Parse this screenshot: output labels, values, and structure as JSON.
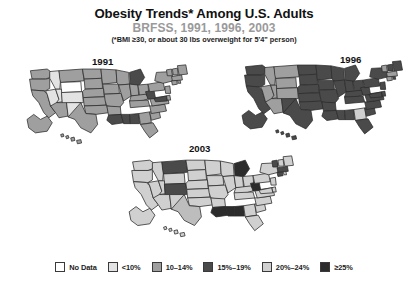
{
  "header": {
    "title": "Obesity Trends* Among U.S. Adults",
    "subtitle": "BRFSS, 1991, 1996, 2003",
    "footnote": "(*BMI ≥30, or about 30 lbs overweight for 5'4\" person)",
    "title_color": "#111111",
    "subtitle_color": "#9a9a9a"
  },
  "maps": [
    {
      "id": "map-1991",
      "year": "1991"
    },
    {
      "id": "map-1996",
      "year": "1996"
    },
    {
      "id": "map-2003",
      "year": "2003"
    }
  ],
  "legend": {
    "items": [
      {
        "label": "No Data",
        "color": "#ffffff"
      },
      {
        "label": "<10%",
        "color": "#e3e3e3"
      },
      {
        "label": "10–14%",
        "color": "#9f9f9f"
      },
      {
        "label": "15%–19%",
        "color": "#4a4a4a"
      },
      {
        "label": "20%–24%",
        "color": "#d0d0d0"
      },
      {
        "label": "≥25%",
        "color": "#2c2c2c"
      }
    ]
  },
  "chart_data": {
    "type": "map",
    "title": "Obesity Trends* Among U.S. Adults",
    "subtitle": "BRFSS, 1991, 1996, 2003",
    "annotation": "(*BMI ≥30, or about 30 lbs overweight for 5'4\" person)",
    "legend_position": "bottom",
    "categories": [
      "No Data",
      "<10%",
      "10–14%",
      "15%–19%",
      "20%–24%",
      "≥25%"
    ],
    "category_colors": [
      "#ffffff",
      "#e3e3e3",
      "#9f9f9f",
      "#4a4a4a",
      "#d0d0d0",
      "#2c2c2c"
    ],
    "panels": [
      {
        "year": "1991",
        "values": {
          "WA": "10–14%",
          "OR": "10–14%",
          "CA": "10–14%",
          "NV": "<10%",
          "ID": "<10%",
          "MT": "10–14%",
          "WY": "No Data",
          "UT": "<10%",
          "AZ": "10–14%",
          "CO": "<10%",
          "NM": "<10%",
          "ND": "10–14%",
          "SD": "10–14%",
          "NE": "10–14%",
          "KS": "10–14%",
          "OK": "10–14%",
          "TX": "10–14%",
          "MN": "10–14%",
          "IA": "10–14%",
          "MO": "10–14%",
          "AR": "10–14%",
          "LA": "15%–19%",
          "WI": "10–14%",
          "IL": "10–14%",
          "MS": "15%–19%",
          "MI": "15%–19%",
          "IN": "10–14%",
          "OH": "10–14%",
          "KY": "10–14%",
          "TN": "10–14%",
          "AL": "15%–19%",
          "GA": "10–14%",
          "FL": "10–14%",
          "SC": "10–14%",
          "NC": "10–14%",
          "VA": "10–14%",
          "WV": "15%–19%",
          "PA": "10–14%",
          "NY": "10–14%",
          "MD": "15%–19%",
          "DE": "10–14%",
          "NJ": "10–14%",
          "CT": "10–14%",
          "RI": "10–14%",
          "MA": "10–14%",
          "VT": "10–14%",
          "NH": "10–14%",
          "ME": "10–14%",
          "AK": "10–14%",
          "HI": "10–14%"
        }
      },
      {
        "year": "1996",
        "values": {
          "WA": "15%–19%",
          "OR": "15%–19%",
          "CA": "15%–19%",
          "NV": "10–14%",
          "ID": "10–14%",
          "MT": "10–14%",
          "WY": "10–14%",
          "UT": "10–14%",
          "AZ": "10–14%",
          "CO": "10–14%",
          "NM": "15%–19%",
          "ND": "15%–19%",
          "SD": "15%–19%",
          "NE": "15%–19%",
          "KS": "15%–19%",
          "OK": "15%–19%",
          "TX": "15%–19%",
          "MN": "15%–19%",
          "IA": "15%–19%",
          "MO": "15%–19%",
          "AR": "15%–19%",
          "LA": "15%–19%",
          "WI": "15%–19%",
          "IL": "15%–19%",
          "MS": "15%–19%",
          "MI": "15%–19%",
          "IN": "15%–19%",
          "OH": "15%–19%",
          "KY": "15%–19%",
          "TN": "15%–19%",
          "AL": "15%–19%",
          "GA": "20%–24%",
          "FL": "15%–19%",
          "SC": "15%–19%",
          "NC": "15%–19%",
          "VA": "15%–19%",
          "WV": "15%–19%",
          "PA": "15%–19%",
          "NY": "15%–19%",
          "MD": "15%–19%",
          "DE": "15%–19%",
          "NJ": "15%–19%",
          "CT": "10–14%",
          "RI": "15%–19%",
          "MA": "10–14%",
          "VT": "10–14%",
          "NH": "15%–19%",
          "ME": "15%–19%",
          "AK": "15%–19%",
          "HI": "15%–19%"
        }
      },
      {
        "year": "2003",
        "values": {
          "WA": "20%–24%",
          "OR": "20%–24%",
          "CA": "20%–24%",
          "NV": "20%–24%",
          "ID": "20%–24%",
          "MT": "15%–19%",
          "WY": "20%–24%",
          "UT": "20%–24%",
          "AZ": "20%–24%",
          "CO": "15%–19%",
          "NM": "20%–24%",
          "ND": "20%–24%",
          "SD": "20%–24%",
          "NE": "20%–24%",
          "KS": "20%–24%",
          "OK": "20%–24%",
          "TX": "25%+",
          "MN": "20%–24%",
          "IA": "20%–24%",
          "MO": "20%–24%",
          "AR": "20%–24%",
          "LA": "≥25%",
          "WI": "20%–24%",
          "IL": "20%–24%",
          "MS": "≥25%",
          "MI": "≥25%",
          "IN": "20%–24%",
          "OH": "20%–24%",
          "KY": "20%–24%",
          "TN": "20%–24%",
          "AL": "≥25%",
          "GA": "20%–24%",
          "FL": "20%–24%",
          "SC": "20%–24%",
          "NC": "20%–24%",
          "VA": "20%–24%",
          "WV": "≥25%",
          "PA": "20%–24%",
          "NY": "20%–24%",
          "MD": "20%–24%",
          "DE": "20%–24%",
          "NJ": "20%–24%",
          "CT": "15%–19%",
          "RI": "20%–24%",
          "MA": "15%–19%",
          "VT": "15%–19%",
          "NH": "20%–24%",
          "ME": "20%–24%",
          "AK": "20%–24%",
          "HI": "20%–24%"
        }
      }
    ]
  }
}
